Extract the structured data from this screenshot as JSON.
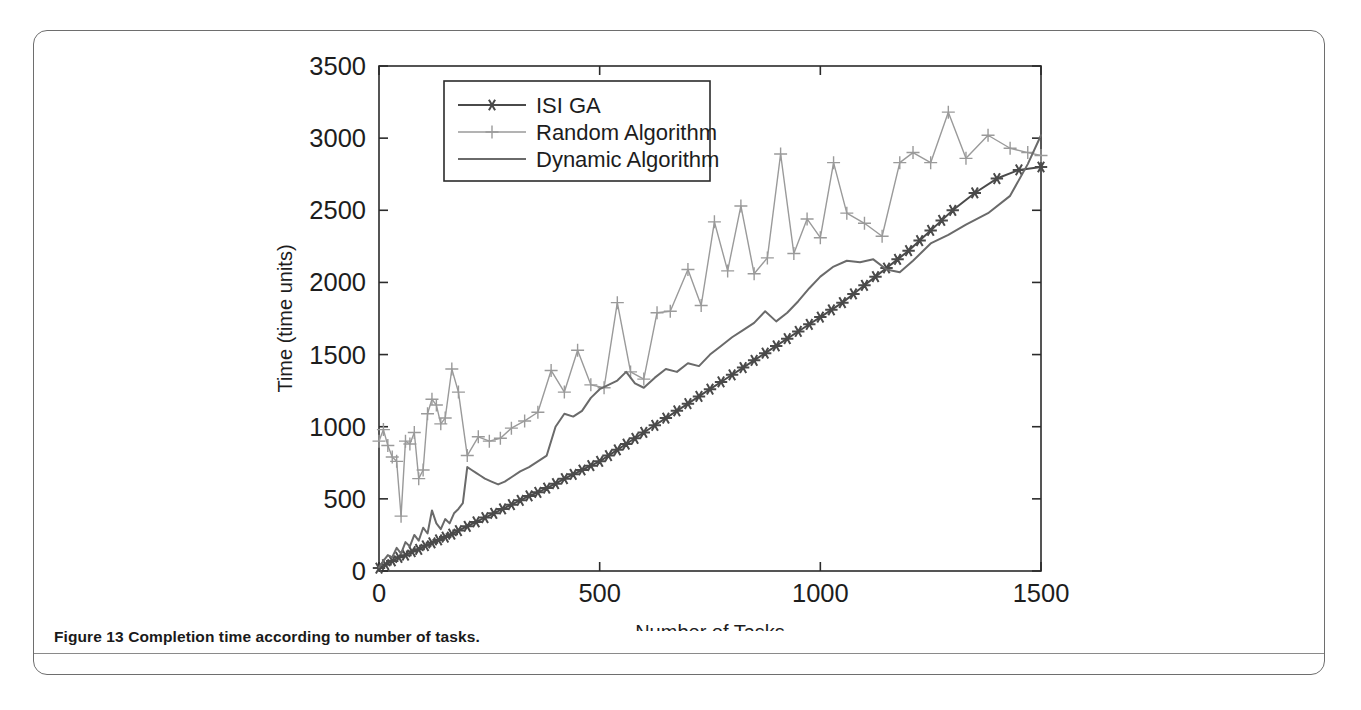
{
  "figure": {
    "caption": "Figure 13 Completion time according to number of tasks."
  },
  "chart_data": {
    "type": "line",
    "title": "",
    "xlabel": "Number of Tasks",
    "ylabel": "Time (time units)",
    "xlim": [
      0,
      1500
    ],
    "ylim": [
      0,
      3500
    ],
    "xticks": [
      0,
      500,
      1000,
      1500
    ],
    "xticklabels": [
      "0",
      "500",
      "1000",
      "1500"
    ],
    "yticks": [
      0,
      500,
      1000,
      1500,
      2000,
      2500,
      3000,
      3500
    ],
    "yticklabels": [
      "0",
      "500",
      "1000",
      "1500",
      "2000",
      "2500",
      "3000",
      "3500"
    ],
    "grid": false,
    "legend_position": "upper left",
    "colors": {
      "isi_ga": "#4a4a4a",
      "random": "#9a9a9a",
      "dynamic": "#6a6a6a",
      "axis": "#2b2b2b",
      "card_border": "#6e6e6e"
    },
    "series": [
      {
        "name": "ISI GA",
        "marker": "star",
        "color": "#4a4a4a",
        "x": [
          0,
          15,
          30,
          45,
          60,
          75,
          90,
          105,
          120,
          135,
          150,
          165,
          180,
          200,
          220,
          240,
          260,
          280,
          300,
          320,
          340,
          360,
          380,
          400,
          420,
          440,
          460,
          480,
          500,
          520,
          540,
          560,
          580,
          600,
          625,
          650,
          675,
          700,
          725,
          750,
          775,
          800,
          825,
          850,
          875,
          900,
          925,
          950,
          975,
          1000,
          1025,
          1050,
          1075,
          1100,
          1125,
          1150,
          1175,
          1200,
          1225,
          1250,
          1275,
          1300,
          1350,
          1400,
          1450,
          1500
        ],
        "y": [
          20,
          45,
          70,
          95,
          110,
          135,
          150,
          175,
          195,
          215,
          235,
          255,
          280,
          310,
          340,
          370,
          400,
          430,
          460,
          490,
          520,
          545,
          575,
          605,
          640,
          670,
          700,
          730,
          760,
          800,
          840,
          880,
          920,
          960,
          1010,
          1060,
          1110,
          1160,
          1210,
          1260,
          1310,
          1360,
          1410,
          1460,
          1510,
          1560,
          1610,
          1660,
          1710,
          1760,
          1810,
          1860,
          1920,
          1980,
          2040,
          2100,
          2160,
          2220,
          2290,
          2360,
          2430,
          2500,
          2620,
          2720,
          2780,
          2800
        ]
      },
      {
        "name": "Random Algorithm",
        "marker": "plus",
        "color": "#9a9a9a",
        "x": [
          0,
          10,
          20,
          30,
          40,
          50,
          60,
          70,
          80,
          90,
          100,
          110,
          120,
          130,
          140,
          150,
          165,
          180,
          200,
          225,
          250,
          275,
          300,
          330,
          360,
          390,
          420,
          450,
          480,
          510,
          540,
          570,
          600,
          630,
          660,
          700,
          730,
          760,
          790,
          820,
          850,
          880,
          910,
          940,
          970,
          1000,
          1030,
          1060,
          1100,
          1140,
          1180,
          1210,
          1250,
          1290,
          1330,
          1380,
          1430,
          1470,
          1500
        ],
        "y": [
          900,
          980,
          870,
          790,
          760,
          380,
          900,
          880,
          960,
          640,
          700,
          1090,
          1190,
          1150,
          1020,
          1060,
          1400,
          1240,
          800,
          930,
          900,
          920,
          990,
          1040,
          1100,
          1390,
          1240,
          1530,
          1290,
          1270,
          1860,
          1380,
          1330,
          1790,
          1800,
          2090,
          1840,
          2420,
          2080,
          2530,
          2060,
          2170,
          2890,
          2200,
          2440,
          2310,
          2830,
          2480,
          2410,
          2320,
          2830,
          2900,
          2830,
          3180,
          2860,
          3020,
          2930,
          2900,
          2880
        ]
      },
      {
        "name": "Dynamic Algorithm",
        "marker": "none",
        "color": "#6a6a6a",
        "x": [
          0,
          10,
          20,
          30,
          40,
          50,
          60,
          70,
          80,
          90,
          100,
          110,
          120,
          130,
          140,
          150,
          160,
          170,
          180,
          190,
          200,
          210,
          220,
          230,
          240,
          255,
          270,
          285,
          300,
          320,
          340,
          360,
          380,
          400,
          420,
          440,
          460,
          480,
          500,
          520,
          540,
          560,
          580,
          600,
          625,
          650,
          675,
          700,
          725,
          750,
          775,
          800,
          825,
          850,
          875,
          900,
          925,
          950,
          975,
          1000,
          1030,
          1060,
          1090,
          1120,
          1150,
          1180,
          1210,
          1250,
          1290,
          1330,
          1380,
          1430,
          1470,
          1500
        ],
        "y": [
          25,
          70,
          110,
          95,
          160,
          120,
          200,
          170,
          250,
          210,
          300,
          260,
          420,
          330,
          290,
          360,
          330,
          400,
          430,
          470,
          720,
          700,
          680,
          660,
          640,
          620,
          600,
          620,
          650,
          690,
          720,
          760,
          800,
          1000,
          1090,
          1070,
          1110,
          1200,
          1260,
          1290,
          1320,
          1380,
          1300,
          1270,
          1340,
          1400,
          1380,
          1440,
          1420,
          1500,
          1560,
          1620,
          1670,
          1720,
          1800,
          1730,
          1790,
          1870,
          1960,
          2040,
          2110,
          2150,
          2140,
          2160,
          2090,
          2070,
          2150,
          2270,
          2330,
          2400,
          2480,
          2600,
          2820,
          3020
        ]
      }
    ]
  }
}
